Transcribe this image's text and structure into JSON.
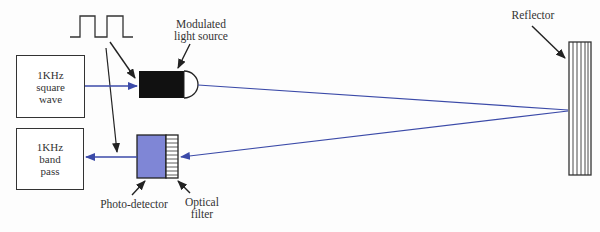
{
  "diagram": {
    "type": "optical reflective sensor block diagram",
    "colors": {
      "beam": "#3b4aa8",
      "detector": "#7f86d6",
      "line": "#333333",
      "light_source": "#111111"
    },
    "blocks": {
      "square_wave": {
        "line1": "1KHz",
        "line2": "square",
        "line3": "wave"
      },
      "band_pass": {
        "line1": "1KHz",
        "line2": "band",
        "line3": "pass"
      }
    },
    "labels": {
      "light_source": {
        "line1": "Modulated",
        "line2": "light source"
      },
      "reflector": "Reflector",
      "photo_detector": "Photo-detector",
      "optical_filter": {
        "line1": "Optical",
        "line2": "filter"
      }
    },
    "waveform_icon": "square-wave-pulse-icon",
    "connections": [
      {
        "from": "1KHz square wave",
        "to": "Modulated light source"
      },
      {
        "from": "Modulated light source",
        "to": "Reflector",
        "kind": "light beam"
      },
      {
        "from": "Reflector",
        "to": "Optical filter / Photo-detector",
        "kind": "reflected beam"
      },
      {
        "from": "Photo-detector",
        "to": "1KHz band pass"
      }
    ]
  }
}
